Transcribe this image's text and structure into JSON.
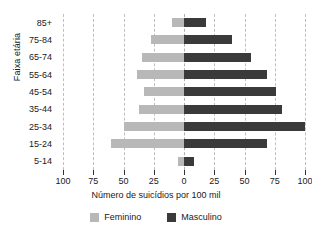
{
  "chart_data": {
    "type": "bar",
    "subtype": "population-pyramid",
    "title": "",
    "xlabel": "Número de suicídios por 100 mil",
    "ylabel": "Faixa etária",
    "orientation": "horizontal-diverging",
    "grid": true,
    "legend_position": "bottom",
    "xlim": [
      -100,
      100
    ],
    "xticks": [
      -100,
      -75,
      -50,
      -25,
      0,
      25,
      50,
      75,
      100
    ],
    "xticklabels": [
      "100",
      "75",
      "50",
      "25",
      "0",
      "25",
      "50",
      "75",
      "100"
    ],
    "categories": [
      "85+",
      "75-84",
      "65-74",
      "55-64",
      "45-54",
      "35-44",
      "25-34",
      "15-24",
      "5-14"
    ],
    "series": [
      {
        "name": "Feminino",
        "side": "left",
        "color": "#b8b8b8",
        "values": [
          10,
          27,
          35,
          39,
          33,
          37,
          50,
          60,
          5
        ]
      },
      {
        "name": "Masculino",
        "side": "right",
        "color": "#3a3a3a",
        "values": [
          18,
          40,
          55,
          69,
          76,
          81,
          100,
          69,
          8
        ]
      }
    ]
  },
  "axis": {
    "y_title": "Faixa etária",
    "x_title": "Número de suicídios por 100 mil",
    "categories": [
      "85+",
      "75-84",
      "65-74",
      "55-64",
      "45-54",
      "35-44",
      "25-34",
      "15-24",
      "5-14"
    ],
    "tick_labels": [
      "100",
      "75",
      "50",
      "25",
      "0",
      "25",
      "50",
      "75",
      "100"
    ]
  },
  "legend": {
    "items": [
      {
        "label": "Feminino",
        "color": "#b8b8b8"
      },
      {
        "label": "Masculino",
        "color": "#3a3a3a"
      }
    ]
  },
  "colors": {
    "feminino": "#b8b8b8",
    "masculino": "#3a3a3a",
    "grid": "#bfbfbf",
    "axis": "#333333",
    "background": "#ffffff"
  }
}
